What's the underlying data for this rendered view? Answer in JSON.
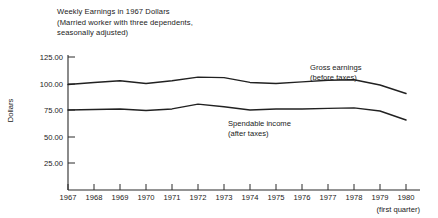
{
  "chart_data": {
    "type": "line",
    "title": "Weekly Earnings in 1967 Dollars",
    "subtitle_line1": "(Married worker with three dependents,",
    "subtitle_line2": "seasonally adjusted)",
    "title_lines": [
      "Weekly Earnings in 1967 Dollars",
      "(Married worker with three dependents,",
      "seasonally adjusted)"
    ],
    "xlabel": "",
    "ylabel": "Dollars",
    "ylim": [
      0,
      125
    ],
    "xlim": [
      1967,
      1980
    ],
    "grid": false,
    "legend_position": "inline-annotation",
    "ytick_labels": [
      "25.00",
      "50.00",
      "75.00",
      "100.00",
      "125.00"
    ],
    "ytick_values": [
      25,
      50,
      75,
      100,
      125
    ],
    "categories": [
      1967,
      1968,
      1969,
      1970,
      1971,
      1972,
      1973,
      1974,
      1975,
      1976,
      1977,
      1978,
      1979,
      1980
    ],
    "xtick_labels": [
      "1967",
      "1968",
      "1969",
      "1970",
      "1971",
      "1972",
      "1973",
      "1974",
      "1975",
      "1976",
      "1977",
      "1978",
      "1979",
      "1980"
    ],
    "x_axis_note": "(first quarter)",
    "series": [
      {
        "name": "Gross earnings",
        "name_line1": "Gross earnings",
        "name_line2": "(before taxes)",
        "values": [
          99.5,
          101.5,
          103.0,
          100.5,
          103.0,
          106.5,
          106.0,
          101.5,
          100.5,
          102.0,
          103.5,
          104.0,
          99.0,
          91.0
        ]
      },
      {
        "name": "Spendable income",
        "name_line1": "Spendable income",
        "name_line2": "(after taxes)",
        "values": [
          75.5,
          76.0,
          76.5,
          75.0,
          76.5,
          81.0,
          78.5,
          75.5,
          76.5,
          76.5,
          77.0,
          77.5,
          74.5,
          66.0
        ]
      }
    ]
  }
}
